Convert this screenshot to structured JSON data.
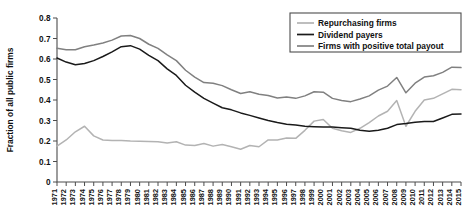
{
  "chart_data": {
    "type": "line",
    "title": "",
    "xlabel": "",
    "ylabel": "Fraction of all public firms",
    "ylim": [
      0,
      0.8
    ],
    "ytick_step": 0.1,
    "grid": false,
    "legend_position": "top-right",
    "ytick_labels": [
      "0",
      "0.1",
      "0.2",
      "0.3",
      "0.4",
      "0.5",
      "0.6",
      "0.7",
      "0.8"
    ],
    "categories": [
      "1971",
      "1972",
      "1973",
      "1974",
      "1975",
      "1976",
      "1977",
      "1978",
      "1979",
      "1980",
      "1981",
      "1982",
      "1983",
      "1984",
      "1985",
      "1986",
      "1987",
      "1988",
      "1989",
      "1990",
      "1991",
      "1992",
      "1993",
      "1994",
      "1995",
      "1996",
      "1997",
      "1998",
      "1999",
      "2000",
      "2001",
      "2002",
      "2003",
      "2004",
      "2005",
      "2006",
      "2007",
      "2008",
      "2009",
      "2010",
      "2011",
      "2012",
      "2013",
      "2014",
      "2015"
    ],
    "series": [
      {
        "name": "Repurchasing firms",
        "color": "#b3b3b3",
        "values": [
          0.175,
          0.205,
          0.245,
          0.272,
          0.225,
          0.205,
          0.203,
          0.202,
          0.2,
          0.199,
          0.198,
          0.196,
          0.19,
          0.196,
          0.18,
          0.178,
          0.188,
          0.175,
          0.183,
          0.172,
          0.16,
          0.178,
          0.172,
          0.205,
          0.205,
          0.215,
          0.213,
          0.252,
          0.297,
          0.305,
          0.262,
          0.25,
          0.242,
          0.262,
          0.29,
          0.322,
          0.345,
          0.397,
          0.272,
          0.345,
          0.4,
          0.408,
          0.43,
          0.452,
          0.45
        ]
      },
      {
        "name": "Dividend payers",
        "color": "#1a1a1a",
        "values": [
          0.605,
          0.585,
          0.572,
          0.578,
          0.592,
          0.612,
          0.635,
          0.66,
          0.665,
          0.648,
          0.618,
          0.592,
          0.552,
          0.52,
          0.472,
          0.438,
          0.408,
          0.385,
          0.362,
          0.352,
          0.337,
          0.325,
          0.312,
          0.3,
          0.29,
          0.282,
          0.278,
          0.272,
          0.27,
          0.268,
          0.268,
          0.265,
          0.262,
          0.252,
          0.247,
          0.252,
          0.262,
          0.28,
          0.285,
          0.292,
          0.295,
          0.295,
          0.312,
          0.33,
          0.332
        ]
      },
      {
        "name": "Firms with positive total payout",
        "color": "#808080",
        "values": [
          0.652,
          0.645,
          0.645,
          0.66,
          0.668,
          0.678,
          0.692,
          0.712,
          0.715,
          0.7,
          0.672,
          0.652,
          0.62,
          0.592,
          0.545,
          0.512,
          0.485,
          0.482,
          0.47,
          0.45,
          0.432,
          0.44,
          0.428,
          0.422,
          0.41,
          0.415,
          0.408,
          0.42,
          0.44,
          0.438,
          0.408,
          0.398,
          0.392,
          0.405,
          0.42,
          0.448,
          0.468,
          0.51,
          0.435,
          0.482,
          0.512,
          0.518,
          0.535,
          0.56,
          0.558
        ]
      }
    ],
    "legend": [
      {
        "label": "Repurchasing firms",
        "color": "#b3b3b3"
      },
      {
        "label": "Dividend payers",
        "color": "#1a1a1a"
      },
      {
        "label": "Firms with positive total payout",
        "color": "#808080"
      }
    ]
  }
}
